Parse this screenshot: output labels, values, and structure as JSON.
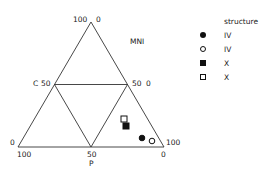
{
  "chart_data": {
    "type": "scatter",
    "subtype": "ternary",
    "title": "",
    "axes": {
      "top_vertex": "MNI",
      "left_label": "C",
      "bottom_label": "P"
    },
    "tick_labels": {
      "apex_left": "100",
      "apex_right": "0",
      "left_mid": "50",
      "right_mid_a": "50",
      "right_mid_b": "0",
      "bottom_left_upper": "0",
      "bottom_left_lower": "100",
      "bottom_mid": "50",
      "bottom_right_upper": "100",
      "bottom_right_lower": "0"
    },
    "series": [
      {
        "name": "IV 4a",
        "marker": "filled-circle",
        "structure": "IV",
        "phase": "4a",
        "x": 142,
        "y": 138
      },
      {
        "name": "IV 4b",
        "marker": "open-circle",
        "structure": "IV",
        "phase": "4b",
        "x": 152,
        "y": 141
      },
      {
        "name": "X 4a",
        "marker": "filled-square",
        "structure": "X",
        "phase": "4a",
        "x": 126,
        "y": 126
      },
      {
        "name": "X 4b",
        "marker": "open-square",
        "structure": "X",
        "phase": "4b",
        "x": 124,
        "y": 119
      }
    ]
  },
  "legend": {
    "header_structure": "structure",
    "header_phase": "phase",
    "rows": [
      {
        "symbol": "filled-circle",
        "structure": "IV",
        "phase": "4a"
      },
      {
        "symbol": "open-circle",
        "structure": "IV",
        "phase": "4b"
      },
      {
        "symbol": "filled-square",
        "structure": "X",
        "phase": "4a"
      },
      {
        "symbol": "open-square",
        "structure": "X",
        "phase": "4b"
      }
    ]
  }
}
